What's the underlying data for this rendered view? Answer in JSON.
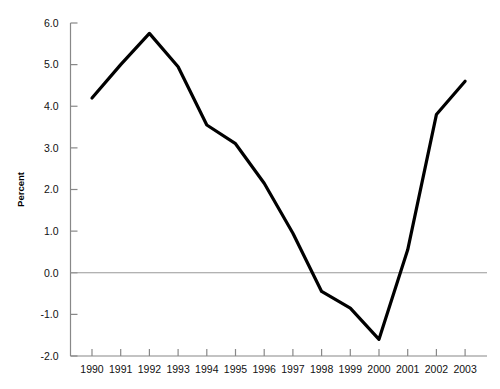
{
  "chart_data": {
    "type": "line",
    "title": "",
    "subtitle": "",
    "xlabel": "",
    "ylabel": "Percent",
    "categories": [
      "1990",
      "1991",
      "1992",
      "1993",
      "1994",
      "1995",
      "1996",
      "1997",
      "1998",
      "1999",
      "2000",
      "2001",
      "2002",
      "2003"
    ],
    "x": [
      1990,
      1991,
      1992,
      1993,
      1994,
      1995,
      1996,
      1997,
      1998,
      1999,
      2000,
      2001,
      2002,
      2003
    ],
    "values": [
      4.2,
      5.0,
      5.75,
      4.95,
      3.55,
      3.1,
      2.15,
      0.95,
      -0.45,
      -0.85,
      -1.6,
      0.55,
      3.8,
      4.6
    ],
    "series": [
      {
        "name": "Percent",
        "values": [
          4.2,
          5.0,
          5.75,
          4.95,
          3.55,
          3.1,
          2.15,
          0.95,
          -0.45,
          -0.85,
          -1.6,
          0.55,
          3.8,
          4.6
        ],
        "color": "#000000"
      }
    ],
    "ylim": [
      -2.0,
      6.0
    ],
    "ytick_labels": [
      "6.0",
      "5.0",
      "4.0",
      "3.0",
      "2.0",
      "1.0",
      "0.0",
      "-1.0",
      "-2.0"
    ],
    "ytick_values": [
      6.0,
      5.0,
      4.0,
      3.0,
      2.0,
      1.0,
      0.0,
      -1.0,
      -2.0
    ],
    "xtick_labels": [
      "1990",
      "1991",
      "1992",
      "1993",
      "1994",
      "1995",
      "1996",
      "1997",
      "1998",
      "1999",
      "2000",
      "2001",
      "2002",
      "2003"
    ],
    "grid": false,
    "zero_line": true,
    "zero_line_color": "#999999",
    "legend": null,
    "legend_position": "none",
    "axis_color": "#888888",
    "line_color": "#000000",
    "line_width": 3.2,
    "background": "#ffffff"
  },
  "axis": {
    "y_label": "Percent",
    "y_ticks": [
      "6.0",
      "5.0",
      "4.0",
      "3.0",
      "2.0",
      "1.0",
      "0.0",
      "-1.0",
      "-2.0"
    ],
    "x_ticks": [
      "1990",
      "1991",
      "1992",
      "1993",
      "1994",
      "1995",
      "1996",
      "1997",
      "1998",
      "1999",
      "2000",
      "2001",
      "2002",
      "2003"
    ]
  }
}
